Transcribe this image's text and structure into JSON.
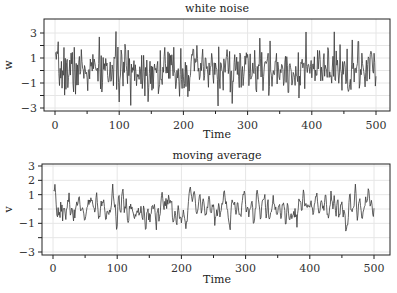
{
  "chart_data": [
    {
      "type": "line",
      "title": "white noise",
      "xlabel": "Time",
      "ylabel": "w",
      "xlim": [
        -5,
        515
      ],
      "ylim": [
        -3.4,
        4.0
      ],
      "xticks": [
        0,
        100,
        200,
        300,
        400,
        500
      ],
      "xtick_labels": [
        "0",
        "100",
        "200",
        "300",
        "400",
        "500"
      ],
      "yticks": [
        -3,
        -2,
        -1,
        0,
        1,
        2,
        3
      ],
      "ytick_labels": [
        "−3",
        "",
        "−1",
        "",
        "1",
        "",
        "3"
      ],
      "grid": true,
      "n_points": 500,
      "seed": 7,
      "smooth": false,
      "description": "Gaussian white noise w_t, t=1..500, roughly within [-3, 3.5]; max spike ~3.4 near t=495"
    },
    {
      "type": "line",
      "title": "moving average",
      "xlabel": "Time",
      "ylabel": "v",
      "xlim": [
        -5,
        515
      ],
      "ylim": [
        -3.2,
        3.2
      ],
      "xticks": [
        0,
        100,
        200,
        300,
        400,
        500
      ],
      "xtick_labels": [
        "0",
        "100",
        "200",
        "300",
        "400",
        "500"
      ],
      "yticks": [
        -3,
        -2,
        -1,
        0,
        1,
        2,
        3
      ],
      "ytick_labels": [
        "−3",
        "",
        "−1",
        "",
        "1",
        "2",
        "3"
      ],
      "grid": true,
      "n_points": 500,
      "seed": 7,
      "smooth": true,
      "description": "3-point moving average v_t of the white noise, roughly within [-1.4, 1.3]"
    }
  ],
  "panels": {
    "top": {
      "title": "white noise",
      "ylabel": "w",
      "xlabel": "Time"
    },
    "bottom": {
      "title": "moving average",
      "ylabel": "v",
      "xlabel": "Time"
    }
  },
  "colors": {
    "line": "#3a3a3a",
    "grid": "#e6e6e6",
    "frame": "#222222"
  }
}
